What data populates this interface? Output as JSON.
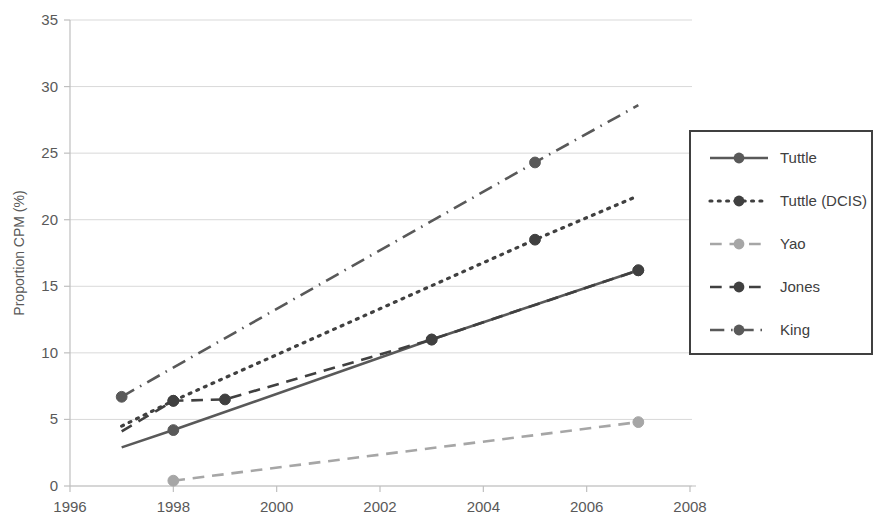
{
  "chart_data": {
    "type": "line",
    "title": "",
    "xlabel": "",
    "ylabel": "Proportion CPM (%)",
    "xlim": [
      1996,
      2008
    ],
    "ylim": [
      0,
      35
    ],
    "xticks": [
      1996,
      1998,
      2000,
      2002,
      2004,
      2006,
      2008
    ],
    "yticks": [
      0,
      5,
      10,
      15,
      20,
      25,
      30,
      35
    ],
    "grid": "horizontal",
    "legend_position": "right",
    "series": [
      {
        "name": "Tuttle",
        "color": "#595959",
        "dash": "solid",
        "x": [
          1997,
          1998,
          2003,
          2007
        ],
        "y": [
          2.9,
          4.2,
          11.0,
          16.2
        ],
        "markers_x": [
          1998,
          2003,
          2007
        ],
        "markers_y": [
          4.2,
          11.0,
          16.2
        ]
      },
      {
        "name": "Tuttle (DCIS)",
        "color": "#404040",
        "dash": "dotted",
        "x": [
          1997,
          1998,
          2005,
          2007
        ],
        "y": [
          4.5,
          6.4,
          18.5,
          21.8
        ],
        "markers_x": [
          1998,
          2005
        ],
        "markers_y": [
          6.4,
          18.5
        ]
      },
      {
        "name": "Yao",
        "color": "#a6a6a6",
        "dash": "dashed",
        "x": [
          1998,
          2007
        ],
        "y": [
          0.4,
          4.8
        ],
        "markers_x": [
          1998,
          2007
        ],
        "markers_y": [
          0.4,
          4.8
        ]
      },
      {
        "name": "Jones",
        "color": "#404040",
        "dash": "dashed",
        "x": [
          1997,
          1998,
          1999,
          2003,
          2007
        ],
        "y": [
          4.1,
          6.4,
          6.5,
          11.0,
          16.2
        ],
        "markers_x": [
          1998,
          1999,
          2003,
          2007
        ],
        "markers_y": [
          6.4,
          6.5,
          11.0,
          16.2
        ]
      },
      {
        "name": "King",
        "color": "#595959",
        "dash": "dashdot",
        "x": [
          1997,
          2005,
          2007
        ],
        "y": [
          6.7,
          24.3,
          28.6
        ],
        "markers_x": [
          1997,
          2005
        ],
        "markers_y": [
          6.7,
          24.3
        ]
      }
    ]
  },
  "axes": {
    "y_title": "Proportion CPM (%)"
  },
  "legend": {
    "items": [
      {
        "label": "Tuttle"
      },
      {
        "label": "Tuttle (DCIS)"
      },
      {
        "label": "Yao"
      },
      {
        "label": "Jones"
      },
      {
        "label": "King"
      }
    ]
  },
  "colors": {
    "gridline": "#d9d9d9",
    "axis": "#bfbfbf",
    "text": "#595959",
    "legend_border": "#404040"
  }
}
